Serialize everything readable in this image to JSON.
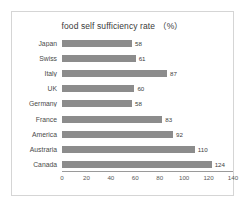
{
  "chart_data": {
    "type": "bar",
    "orientation": "horizontal",
    "title": "food self sufficiency rate （%）",
    "xlabel": "",
    "ylabel": "",
    "categories": [
      "Japan",
      "Swiss",
      "Italy",
      "UK",
      "Germany",
      "France",
      "America",
      "Austraria",
      "Canada"
    ],
    "values": [
      58,
      61,
      87,
      60,
      58,
      83,
      92,
      110,
      124
    ],
    "value_labels": [
      "58",
      "61",
      "87",
      "60",
      "58",
      "83",
      "92",
      "110",
      "124"
    ],
    "xlim": [
      0,
      140
    ],
    "xticks": [
      0,
      20,
      40,
      60,
      80,
      100,
      120,
      140
    ],
    "xtick_labels": [
      "0",
      "20",
      "40",
      "60",
      "80",
      "100",
      "120",
      "140"
    ],
    "grid": false,
    "legend": false,
    "bar_color": "#8c8c8c",
    "axis_color": "#9a9a9a",
    "frame_color": "#d5d5d5",
    "background": "#ffffff"
  }
}
